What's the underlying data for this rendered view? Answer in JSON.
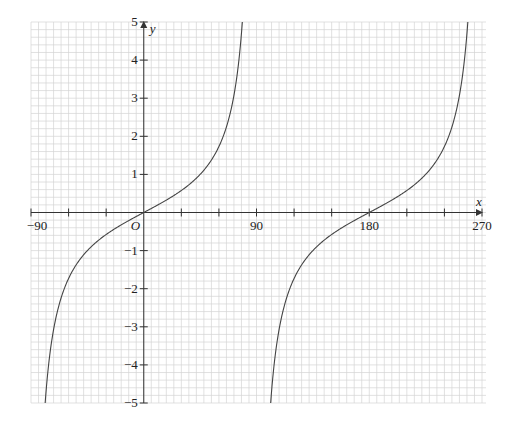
{
  "figure": {
    "origin_label": "O",
    "x_axis_name": "x",
    "y_axis_name": "y",
    "colors": {
      "background": "#ffffff",
      "grid_minor": "#d4d4d4",
      "axis": "#333333",
      "curve": "#444444"
    }
  },
  "chart_data": {
    "type": "line",
    "title": "",
    "function": "y = tan x",
    "xlabel": "x",
    "ylabel": "y",
    "xlim": [
      -90,
      270
    ],
    "ylim": [
      -5,
      5
    ],
    "grid": true,
    "x_minor_step": 6,
    "y_minor_step": 0.2,
    "x_tick_step": 30,
    "x_tick_labels": [
      {
        "value": -90,
        "label": "−90"
      },
      {
        "value": 90,
        "label": "90"
      },
      {
        "value": 180,
        "label": "180"
      },
      {
        "value": 270,
        "label": "270"
      }
    ],
    "y_tick_labels": [
      {
        "value": 5,
        "label": "5"
      },
      {
        "value": 4,
        "label": "4"
      },
      {
        "value": 3,
        "label": "3"
      },
      {
        "value": 2,
        "label": "2"
      },
      {
        "value": 1,
        "label": "1"
      },
      {
        "value": -1,
        "label": "−1"
      },
      {
        "value": -2,
        "label": "−2"
      },
      {
        "value": -3,
        "label": "−3"
      },
      {
        "value": -4,
        "label": "−4"
      },
      {
        "value": -5,
        "label": "−5"
      }
    ],
    "asymptotes": [
      90
    ],
    "series": [
      {
        "name": "branch 1",
        "x_range": [
          -78.7,
          78.7
        ],
        "sample": [
          [
            -78.7,
            -5
          ],
          [
            -45,
            -1
          ],
          [
            0,
            0
          ],
          [
            45,
            1
          ],
          [
            78.7,
            5
          ]
        ]
      },
      {
        "name": "branch 2",
        "x_range": [
          101.3,
          258.7
        ],
        "sample": [
          [
            101.3,
            -5
          ],
          [
            135,
            -1
          ],
          [
            180,
            0
          ],
          [
            225,
            1
          ],
          [
            258.7,
            5
          ]
        ]
      }
    ]
  },
  "layout": {
    "plot_left": 31,
    "plot_right": 486,
    "plot_top": 22,
    "plot_bottom": 403,
    "x_min_px": 31,
    "x_max_px": 482
  }
}
